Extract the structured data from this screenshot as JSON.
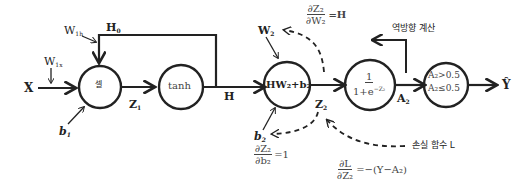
{
  "diagram": {
    "inputs": {
      "x_label": "X",
      "w1x_label": "W",
      "w1x_sub": "1x",
      "w1h_label": "W",
      "w1h_sub": "1h",
      "h0_label": "H",
      "h0_sub": "0",
      "b1_label": "b",
      "b1_sub": "1"
    },
    "nodes": {
      "cell": "셀",
      "tanh": "tanh",
      "linear": "HW₂+b₂",
      "sigmoid_num": "1",
      "sigmoid_den": "1+e",
      "sigmoid_exp": "−Z₂",
      "threshold_line1": "A₂>0.5",
      "threshold_line2": "A₂≤0.5"
    },
    "edges": {
      "z1_label": "Z",
      "z1_sub": "1",
      "h_label": "H",
      "w2_label": "W",
      "w2_sub": "2",
      "b2_label": "b",
      "b2_sub": "2",
      "z2_label": "Z",
      "z2_sub": "2",
      "a2_label": "A",
      "a2_sub": "2",
      "output_label": "Ŷ"
    },
    "annotations": {
      "backward_label": "역방향 계산",
      "loss_label": "손실 함수 L",
      "dz2_dw2_num": "∂Z₂",
      "dz2_dw2_den": "∂W₂",
      "dz2_dw2_val": "=H",
      "dz2_db2_num": "∂Z₂",
      "dz2_db2_den": "∂b₂",
      "dz2_db2_val": "=1",
      "dl_dz2_num": "∂L",
      "dl_dz2_den": "∂Z₂",
      "dl_dz2_val": "=−(Y−A₂)"
    },
    "colors": {
      "stroke": "#222222",
      "text": "#222222",
      "formula_text": "#444444",
      "background": "#ffffff"
    }
  }
}
